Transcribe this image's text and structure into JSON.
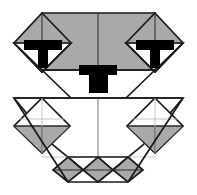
{
  "figure": {
    "canvas": {
      "width": 197,
      "height": 195
    },
    "colors": {
      "background": "#ffffff",
      "fill_gray": "#a9a9a9",
      "fill_white": "#ffffff",
      "ink_black": "#000000",
      "stroke_main": "#1a1a1a",
      "stroke_thin": "#2b2b2b",
      "stroke_hair": "#555555",
      "stroke_light": "#bdbdbd"
    },
    "parts": [
      {
        "id": "upper-left-wing",
        "label": "upper left gray diamond wing",
        "fill": "#a9a9a9"
      },
      {
        "id": "upper-right-wing",
        "label": "upper right gray diamond wing",
        "fill": "#a9a9a9"
      },
      {
        "id": "upper-center-band",
        "label": "upper center gray band",
        "fill": "#a9a9a9"
      },
      {
        "id": "lower-left-diamond",
        "label": "lower left diamond",
        "fill": "#ffffff"
      },
      {
        "id": "lower-right-diamond",
        "label": "lower right diamond",
        "fill": "#ffffff"
      },
      {
        "id": "bottom-diamond-1",
        "label": "bottom row diamond 1",
        "fill": "#a9a9a9"
      },
      {
        "id": "bottom-diamond-2",
        "label": "bottom row diamond 2",
        "fill": "#a9a9a9"
      },
      {
        "id": "bottom-diamond-3",
        "label": "bottom row diamond 3",
        "fill": "#a9a9a9"
      }
    ],
    "markers": [
      {
        "id": "tab-left",
        "label": "left T marker",
        "x": 43,
        "y": 40
      },
      {
        "id": "tab-right",
        "label": "right T marker",
        "x": 154,
        "y": 40
      },
      {
        "id": "tab-center",
        "label": "center T marker",
        "x": 98,
        "y": 68
      }
    ],
    "vertices": {
      "top_left_apex": [
        42,
        13
      ],
      "top_right_apex": [
        155,
        13
      ],
      "left_outer": [
        14,
        43
      ],
      "right_outer": [
        183,
        43
      ],
      "band_bottom_y": 70,
      "mid_line_y": 98,
      "bottom_row_y": [
        157,
        182
      ]
    }
  }
}
